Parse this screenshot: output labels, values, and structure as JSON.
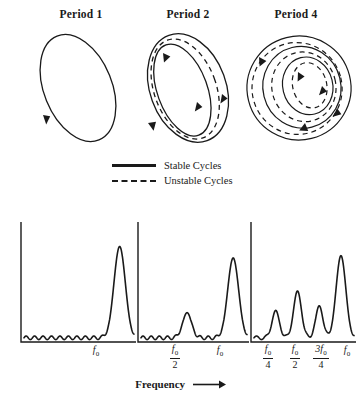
{
  "figure": {
    "panel_titles": [
      "Period 1",
      "Period 2",
      "Period 4"
    ],
    "axis_caption": "Frequency",
    "axis_arrow": "→"
  },
  "legend": {
    "items": [
      {
        "label": "Stable Cycles",
        "style": "solid"
      },
      {
        "label": "Unstable Cycles",
        "style": "dashed"
      }
    ]
  },
  "tick_labels": {
    "panel1": [
      {
        "num": "f",
        "sub": "0",
        "den": null
      }
    ],
    "panel2": [
      {
        "num": "f",
        "sub": "0",
        "den": "2"
      },
      {
        "num": "f",
        "sub": "0",
        "den": null
      }
    ],
    "panel3": [
      {
        "num": "f",
        "sub": "0",
        "den": "4"
      },
      {
        "num": "f",
        "sub": "0",
        "den": "2"
      },
      {
        "num": "3f",
        "sub": "0",
        "den": "4"
      },
      {
        "num": "f",
        "sub": "0",
        "den": null
      }
    ]
  },
  "chart_data": [
    {
      "type": "line",
      "title": "Period 1",
      "xlabel": "Frequency",
      "ylabel": "",
      "xlim": [
        0,
        1.15
      ],
      "ylim": [
        0,
        1
      ],
      "grid": false,
      "legend_position": "above",
      "peaks": [
        {
          "x": 1.0,
          "height": 0.82,
          "width": 0.085,
          "label": "f0"
        }
      ],
      "baseline_noise": {
        "amplitude": 0.035,
        "cycles": 13
      },
      "annotations": [
        "single fundamental peak at f0"
      ]
    },
    {
      "type": "line",
      "title": "Period 2",
      "xlabel": "Frequency",
      "ylabel": "",
      "xlim": [
        0,
        1.15
      ],
      "ylim": [
        0,
        1
      ],
      "grid": false,
      "legend_position": "above",
      "peaks": [
        {
          "x": 0.5,
          "height": 0.24,
          "width": 0.07,
          "label": "f0/2"
        },
        {
          "x": 1.0,
          "height": 0.72,
          "width": 0.085,
          "label": "f0"
        }
      ],
      "baseline_noise": {
        "amplitude": 0.035,
        "cycles": 13
      },
      "annotations": [
        "subharmonic appears at f0/2"
      ]
    },
    {
      "type": "line",
      "title": "Period 4",
      "xlabel": "Frequency",
      "ylabel": "",
      "xlim": [
        0,
        1.15
      ],
      "ylim": [
        0,
        1
      ],
      "grid": false,
      "legend_position": "above",
      "peaks": [
        {
          "x": 0.25,
          "height": 0.26,
          "width": 0.06,
          "label": "f0/4"
        },
        {
          "x": 0.5,
          "height": 0.43,
          "width": 0.065,
          "label": "f0/2"
        },
        {
          "x": 0.75,
          "height": 0.3,
          "width": 0.06,
          "label": "3f0/4"
        },
        {
          "x": 1.0,
          "height": 0.74,
          "width": 0.08,
          "label": "f0"
        }
      ],
      "baseline_noise": {
        "amplitude": 0.035,
        "cycles": 10
      },
      "annotations": [
        "subharmonics at f0/4, f0/2 and 3f0/4"
      ]
    }
  ],
  "phase_portraits": [
    {
      "title": "Period 1",
      "solid_loops": 1,
      "dashed_loops": 0,
      "arrows": 1
    },
    {
      "title": "Period 2",
      "solid_loops": 2,
      "dashed_loops": 1,
      "arrows": 4
    },
    {
      "title": "Period 4",
      "solid_loops": 3,
      "dashed_loops": 3,
      "arrows": 5
    }
  ],
  "colors": {
    "ink": "#1a1a1a",
    "background": "#ffffff"
  }
}
